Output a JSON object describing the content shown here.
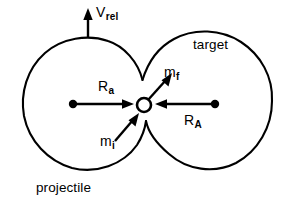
{
  "figure": {
    "type": "physics-collision-schematic",
    "background_color": "#ffffff",
    "line_color": "#000000",
    "labels": {
      "velocity": {
        "symbol": "V",
        "subscript": "rel",
        "full": "Vrel"
      },
      "target": "target",
      "projectile": "projectile",
      "radius_projectile": {
        "symbol": "R",
        "subscript": "a",
        "full": "Ra"
      },
      "radius_target": {
        "symbol": "R",
        "subscript": "A",
        "full": "RA"
      },
      "mass_final": {
        "symbol": "m",
        "subscript": "f",
        "full": "mf"
      },
      "mass_initial": {
        "symbol": "m",
        "subscript": "i",
        "full": "mi"
      }
    },
    "geometry": {
      "projectile_circle": {
        "cx": 85,
        "cy": 104,
        "r": 65
      },
      "target_circle": {
        "cx": 210,
        "cy": 104,
        "r": 70
      },
      "contact_node": {
        "cx": 144,
        "cy": 105,
        "r": 7
      },
      "projectile_center_dot": {
        "cx": 73,
        "cy": 104,
        "r": 4
      },
      "target_center_dot": {
        "cx": 215,
        "cy": 104,
        "r": 4
      }
    },
    "arrows": [
      {
        "name": "v-rel-arrow",
        "from": [
          88,
          37
        ],
        "to": [
          88,
          11
        ],
        "direction": "up"
      },
      {
        "name": "r-a-arrow",
        "from": [
          76,
          104
        ],
        "to": [
          133,
          104
        ],
        "direction": "right"
      },
      {
        "name": "r-A-arrow",
        "from": [
          212,
          104
        ],
        "to": [
          156,
          104
        ],
        "direction": "left"
      },
      {
        "name": "m-f-arrow",
        "from": [
          148,
          99
        ],
        "to": [
          172,
          74
        ],
        "direction": "up-right"
      },
      {
        "name": "m-i-arrow",
        "from": [
          117,
          139
        ],
        "to": [
          139,
          113
        ],
        "direction": "up-right"
      }
    ]
  }
}
